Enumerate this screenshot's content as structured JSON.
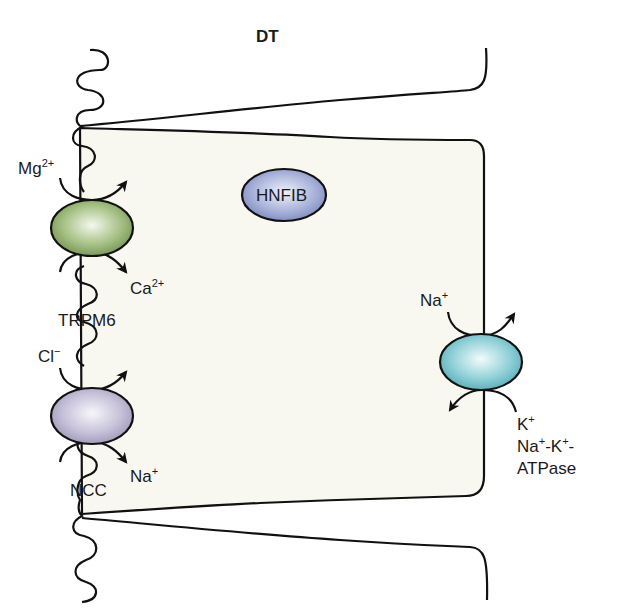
{
  "diagram": {
    "title": "DT",
    "cell": {
      "fill": "#f8f8f0",
      "stroke": "#111111"
    },
    "nucleus_protein": {
      "label": "HNFIB",
      "fill": "#a9b3d8"
    },
    "transporters": [
      {
        "id": "trpm6",
        "name": "TRPM6",
        "fill": "#8fae6a",
        "ion_in": {
          "base": "Mg",
          "sup": "2+"
        },
        "ion_out": {
          "base": "Ca",
          "sup": "2+"
        }
      },
      {
        "id": "ncc",
        "name": "NCC",
        "fill": "#b8b2cc",
        "ion_in": {
          "base": "Cl",
          "sup": "−"
        },
        "ion_out": {
          "base": "Na",
          "sup": "+"
        }
      },
      {
        "id": "nak-atpase",
        "name_line1_parts": [
          "Na",
          "+",
          "-K",
          "+",
          "-"
        ],
        "name_line2": "ATPase",
        "fill": "#7cc6cf",
        "ion_a": {
          "base": "Na",
          "sup": "+"
        },
        "ion_b": {
          "base": "K",
          "sup": "+"
        }
      }
    ]
  }
}
